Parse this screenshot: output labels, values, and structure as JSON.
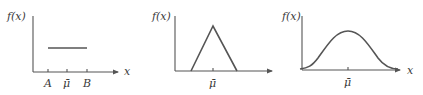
{
  "panels": [
    {
      "name": "uniform",
      "y_label": "f(x)",
      "x_label": "x",
      "tick_labels": [
        "A",
        "μ̄",
        "B"
      ]
    },
    {
      "name": "triangular",
      "y_label": "f(x)",
      "x_label": "",
      "tick_labels": [
        "μ̄"
      ]
    },
    {
      "name": "bell",
      "y_label": "f(x)",
      "x_label": "x",
      "tick_labels": [
        "μ̄"
      ]
    }
  ],
  "colors": {
    "line": "#555555",
    "text": "#3a3a3a",
    "background": "#ffffff"
  }
}
